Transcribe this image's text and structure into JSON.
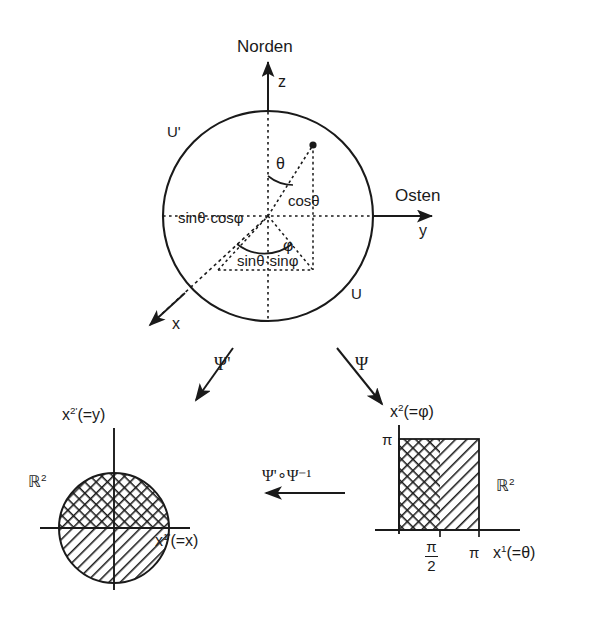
{
  "figure": {
    "type": "math-diagram"
  },
  "sphere": {
    "north_label": "Norden",
    "east_label": "Osten",
    "axis_z": "z",
    "axis_y": "y",
    "axis_x": "x",
    "chart_u_prime": "U'",
    "chart_u": "U",
    "angle_theta": "θ",
    "angle_phi": "φ",
    "comp_z": "cosθ",
    "comp_x": "sinθ·cosφ",
    "comp_y": "sinθ·sinφ"
  },
  "maps": {
    "psi_prime": "Ψ'",
    "psi": "Ψ",
    "transition": "Ψ'∘Ψ⁻¹"
  },
  "left_chart": {
    "space_label": "ℝ",
    "space_exp": "2",
    "axis_vertical_base": "x",
    "axis_vertical_exp": "2'",
    "axis_vertical_paren": "(=y)",
    "axis_horizontal_base": "x",
    "axis_horizontal_exp": "1'",
    "axis_horizontal_paren": "(=x)"
  },
  "right_chart": {
    "space_label": "ℝ",
    "space_exp": "2",
    "axis_vertical_base": "x",
    "axis_vertical_exp": "2",
    "axis_vertical_paren": "(=φ)",
    "axis_horizontal_base": "x",
    "axis_horizontal_exp": "1",
    "axis_horizontal_paren": "(=θ)",
    "tick_y_pi": "π",
    "tick_x_pi": "π",
    "tick_x_half_pi_num": "π",
    "tick_x_half_pi_den": "2"
  },
  "colors": {
    "ink": "#1a1a1a",
    "background": "#ffffff"
  }
}
